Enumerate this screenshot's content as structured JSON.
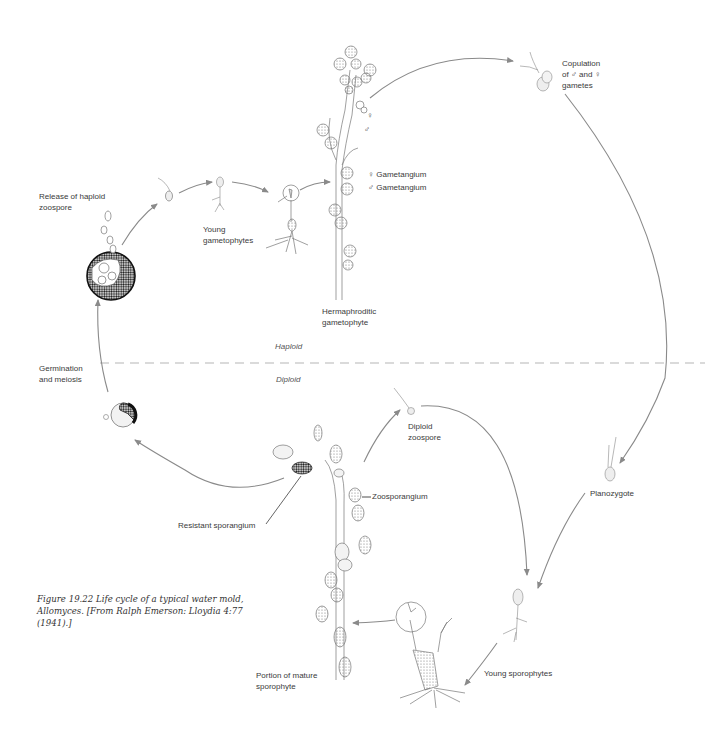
{
  "figure": {
    "caption_lines": [
      "Figure 19.22   Life cycle of a typical water mold,",
      "Allomyces. [From Ralph Emerson: Lloydia 4:77",
      "(1941).]"
    ]
  },
  "phases": {
    "haploid": "Haploid",
    "diploid": "Diploid"
  },
  "labels": {
    "release_haploid": [
      "Release of haploid",
      "zoospore"
    ],
    "young_gametophytes": [
      "Young",
      "gametophytes"
    ],
    "female_gametangium": "♀  Gametangium",
    "male_gametangium": "♂  Gametangium",
    "female_symbol": "♀",
    "male_symbol": "♂",
    "hermaphroditic": [
      "Hermaphroditic",
      "gametophyte"
    ],
    "copulation": [
      "Copulation",
      "of ♂ and ♀",
      "gametes"
    ],
    "germination": [
      "Germination",
      "and meiosis"
    ],
    "diploid_zoospore": [
      "Diploid",
      "zoospore"
    ],
    "zoosporangium": "Zoosporangium",
    "resistant_sporangium": "Resistant sporangium",
    "planozygote": "Planozygote",
    "portion_mature": [
      "Portion of mature",
      "sporophyte"
    ],
    "young_sporophytes": "Young sporophytes"
  },
  "colors": {
    "arrow": "#8a8a8a",
    "dashed_divider": "#b5b5b5",
    "ink": "#555555",
    "dark_spore": "#1e1e1e"
  }
}
